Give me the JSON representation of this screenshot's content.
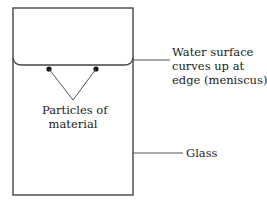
{
  "diagram": {
    "colors": {
      "stroke": "#444444",
      "particle": "#111111",
      "text": "#222222",
      "background": "#ffffff"
    },
    "labels": {
      "particles_line1": "Particles of",
      "particles_line2": "material",
      "meniscus_line1": "Water surface",
      "meniscus_line2": "curves up at",
      "meniscus_line3": "edge (meniscus)",
      "glass": "Glass"
    },
    "elements": {
      "glass": {
        "x": 13,
        "y": 8,
        "width": 120,
        "height": 187
      },
      "water_surface_y": 65,
      "meniscus_edge_y": 58,
      "particles": [
        {
          "x": 49,
          "y": 69
        },
        {
          "x": 96,
          "y": 69
        }
      ],
      "pointer_apex": {
        "x": 73,
        "y": 100
      },
      "meniscus_leader": {
        "x1": 133,
        "y": 60,
        "x2": 170
      },
      "glass_leader": {
        "x1": 133,
        "y": 153,
        "x2": 183
      }
    }
  }
}
